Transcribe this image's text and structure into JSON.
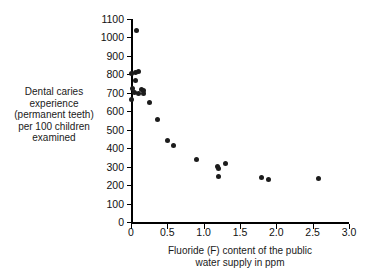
{
  "chart_data": {
    "type": "scatter",
    "title": "",
    "xlabel": "Fluoride (F) content of the public water supply in ppm",
    "xlabel_lines": [
      "Fluoride (F) content of the public",
      "water supply in ppm"
    ],
    "ylabel": "Dental caries experience (permanent teeth) per 100 children examined",
    "ylabel_lines": [
      "Dental caries",
      "experience",
      "(permanent teeth)",
      "per 100 children",
      "examined"
    ],
    "xlim": [
      0,
      3.0
    ],
    "ylim": [
      0,
      1100
    ],
    "xticks": [
      0,
      0.5,
      1.0,
      1.5,
      2.0,
      2.5,
      3.0
    ],
    "xtick_labels": [
      "0",
      "0.5",
      "1.0",
      "1.5",
      "2.0",
      "2.5",
      "3.0"
    ],
    "yticks": [
      0,
      100,
      200,
      300,
      400,
      500,
      600,
      700,
      800,
      900,
      1000,
      1100
    ],
    "ytick_labels": [
      "0",
      "100",
      "200",
      "300",
      "400",
      "500",
      "600",
      "700",
      "800",
      "900",
      "1000",
      "1100"
    ],
    "grid": false,
    "legend": false,
    "marker_color": "#1c1c1c",
    "axis_color": "#000000",
    "background": "#ffffff",
    "x": [
      0.08,
      0.0,
      0.06,
      0.1,
      0.06,
      0.02,
      0.05,
      0.15,
      0.17,
      0.1,
      0.17,
      0.0,
      0.26,
      0.37,
      0.5,
      0.58,
      0.9,
      1.19,
      1.2,
      1.2,
      1.3,
      1.8,
      1.89,
      2.58
    ],
    "y": [
      1035,
      805,
      810,
      818,
      765,
      722,
      700,
      718,
      712,
      697,
      697,
      665,
      700,
      645,
      553,
      440,
      412,
      341,
      300,
      292,
      249,
      318,
      240,
      231,
      237
    ],
    "points": [
      {
        "x": 0.08,
        "y": 1035
      },
      {
        "x": 0.0,
        "y": 805
      },
      {
        "x": 0.06,
        "y": 810
      },
      {
        "x": 0.1,
        "y": 818
      },
      {
        "x": 0.06,
        "y": 765
      },
      {
        "x": 0.02,
        "y": 722
      },
      {
        "x": 0.05,
        "y": 700
      },
      {
        "x": 0.15,
        "y": 718
      },
      {
        "x": 0.17,
        "y": 712
      },
      {
        "x": 0.1,
        "y": 697
      },
      {
        "x": 0.17,
        "y": 697
      },
      {
        "x": 0.0,
        "y": 665
      },
      {
        "x": 0.26,
        "y": 645
      },
      {
        "x": 0.37,
        "y": 553
      },
      {
        "x": 0.5,
        "y": 440
      },
      {
        "x": 0.58,
        "y": 412
      },
      {
        "x": 0.9,
        "y": 341
      },
      {
        "x": 1.19,
        "y": 300
      },
      {
        "x": 1.2,
        "y": 292
      },
      {
        "x": 1.2,
        "y": 249
      },
      {
        "x": 1.3,
        "y": 318
      },
      {
        "x": 1.8,
        "y": 240
      },
      {
        "x": 1.89,
        "y": 231
      },
      {
        "x": 2.58,
        "y": 237
      }
    ]
  }
}
